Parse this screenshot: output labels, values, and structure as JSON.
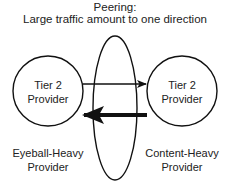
{
  "title": {
    "line1": "Peering:",
    "line2": "Large traffic amount to one direction"
  },
  "nodes": [
    {
      "id": "left",
      "label_line1": "Tier 2",
      "label_line2": "Provider",
      "caption_line1": "Eyeball-Heavy",
      "caption_line2": "Provider"
    },
    {
      "id": "right",
      "label_line1": "Tier 2",
      "label_line2": "Provider",
      "caption_line1": "Content-Heavy",
      "caption_line2": "Provider"
    }
  ],
  "edges": [
    {
      "from": "left",
      "to": "right",
      "weight": "thin",
      "meaning": "small traffic"
    },
    {
      "from": "right",
      "to": "left",
      "weight": "thick",
      "meaning": "large traffic"
    }
  ],
  "peering_boundary": {
    "shape": "ellipse"
  },
  "colors": {
    "stroke": "#111111",
    "background": "#ffffff",
    "text": "#222222"
  }
}
